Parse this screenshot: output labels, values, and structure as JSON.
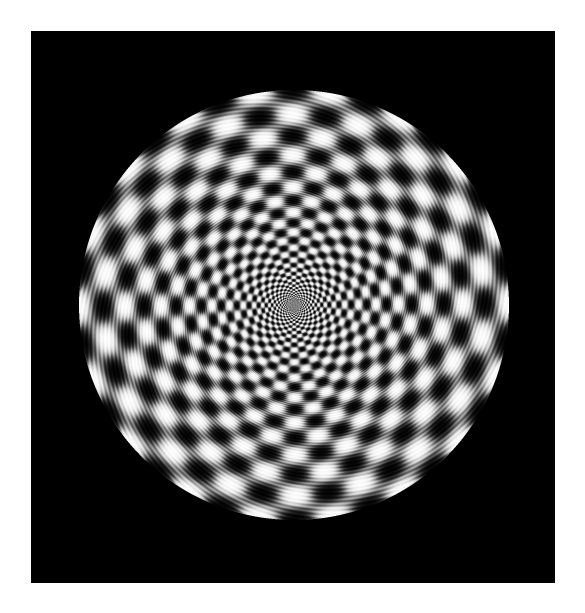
{
  "page": {
    "width": 585,
    "height": 613,
    "background_color": "#ffffff"
  },
  "frame": {
    "name": "stimulus-frame",
    "x": 31,
    "y": 31,
    "width": 524,
    "height": 552,
    "background_color": "#000000"
  },
  "margins": {
    "top": 31,
    "left": 31,
    "right": 30,
    "bottom": 30,
    "color": "#ffffff"
  },
  "chart_data": {
    "type": "heatmap",
    "title": "",
    "subtitle": "",
    "xlabel": "",
    "ylabel": "",
    "grid": false,
    "legend": "none",
    "colormap": "grayscale",
    "value_range": [
      0,
      255
    ],
    "disc": {
      "center_x": 294,
      "center_y": 305,
      "radius": 215,
      "center_x_in_frame": 263,
      "center_y_in_frame": 274,
      "edge": "hard"
    },
    "components": [
      {
        "name": "angular-grating",
        "cycles": 18,
        "phase_deg": 8,
        "weight": 1.0
      },
      {
        "name": "log-radial-grating",
        "cycles_per_log_unit": 4.15,
        "log_base": "natural",
        "r_reference": 215,
        "phase": 0.0,
        "weight": 1.0
      },
      {
        "name": "fine-carrier-ripple",
        "radial_cycles": 96,
        "angular_cycles": 54,
        "amplitude": 0.16
      }
    ],
    "axis_ranges": {
      "theta": [
        0,
        360
      ],
      "r": [
        0,
        215
      ]
    }
  },
  "canvas": {
    "name": "stimulus-canvas",
    "alt": "Greyscale circular log-polar radial grating pattern on black background"
  }
}
